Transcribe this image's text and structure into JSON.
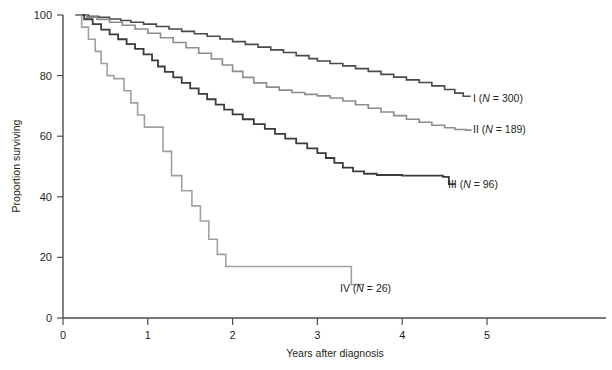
{
  "chart_data": {
    "type": "line",
    "subtype": "kaplan-meier-step",
    "title": "",
    "xlabel": "Years after diagnosis",
    "ylabel": "Proportion surviving",
    "xlim": [
      0,
      5.6
    ],
    "ylim": [
      0,
      100
    ],
    "xticks": [
      0,
      1,
      2,
      3,
      4,
      5
    ],
    "xtick_labels": [
      "0",
      "1",
      "2",
      "3",
      "4",
      "5"
    ],
    "yticks": [
      0,
      20,
      40,
      60,
      80,
      100
    ],
    "ytick_labels": [
      "0",
      "20",
      "40",
      "60",
      "80",
      "100"
    ],
    "grid": false,
    "legend_position": "right-inline-end-of-curve",
    "series": [
      {
        "name": "I",
        "n": 300,
        "label": "I (N = 300)",
        "label_roman": "I",
        "label_n_prefix": "(",
        "label_n_letter": "N",
        "label_n_value": " = 300)",
        "color": "#4a4a4a",
        "width": 1.6,
        "end_value": 73,
        "label_x": 473,
        "label_y": 102,
        "points": [
          [
            0.15,
            100
          ],
          [
            0.3,
            99.6
          ],
          [
            0.42,
            99.2
          ],
          [
            0.55,
            98.7
          ],
          [
            0.68,
            98.2
          ],
          [
            0.8,
            97.6
          ],
          [
            0.95,
            97.0
          ],
          [
            1.1,
            96.2
          ],
          [
            1.25,
            95.4
          ],
          [
            1.4,
            94.6
          ],
          [
            1.55,
            93.8
          ],
          [
            1.7,
            93.0
          ],
          [
            1.85,
            92.1
          ],
          [
            2.0,
            91.2
          ],
          [
            2.15,
            90.3
          ],
          [
            2.3,
            89.4
          ],
          [
            2.45,
            88.5
          ],
          [
            2.6,
            87.6
          ],
          [
            2.75,
            86.6
          ],
          [
            2.9,
            85.6
          ],
          [
            3.0,
            84.8
          ],
          [
            3.15,
            84.0
          ],
          [
            3.3,
            83.2
          ],
          [
            3.45,
            82.3
          ],
          [
            3.6,
            81.4
          ],
          [
            3.75,
            80.4
          ],
          [
            3.9,
            79.5
          ],
          [
            4.05,
            78.6
          ],
          [
            4.2,
            77.7
          ],
          [
            4.35,
            76.6
          ],
          [
            4.5,
            75.4
          ],
          [
            4.62,
            74.2
          ],
          [
            4.72,
            73.2
          ],
          [
            4.8,
            73.0
          ]
        ]
      },
      {
        "name": "II",
        "n": 189,
        "label": "II (N = 189)",
        "label_roman": "II",
        "label_n_prefix": "(",
        "label_n_letter": "N",
        "label_n_value": " = 189)",
        "color": "#8c8c8c",
        "width": 1.6,
        "end_value": 62,
        "label_x": 473,
        "label_y": 133,
        "points": [
          [
            0.15,
            100
          ],
          [
            0.28,
            99.3
          ],
          [
            0.4,
            98.5
          ],
          [
            0.55,
            97.6
          ],
          [
            0.7,
            96.6
          ],
          [
            0.85,
            95.4
          ],
          [
            1.0,
            94.0
          ],
          [
            1.15,
            92.5
          ],
          [
            1.3,
            90.9
          ],
          [
            1.45,
            89.2
          ],
          [
            1.6,
            87.4
          ],
          [
            1.75,
            85.5
          ],
          [
            1.88,
            83.5
          ],
          [
            2.0,
            81.4
          ],
          [
            2.12,
            79.4
          ],
          [
            2.25,
            77.6
          ],
          [
            2.4,
            76.2
          ],
          [
            2.55,
            75.2
          ],
          [
            2.7,
            74.4
          ],
          [
            2.85,
            73.8
          ],
          [
            3.0,
            73.3
          ],
          [
            3.15,
            72.6
          ],
          [
            3.3,
            71.6
          ],
          [
            3.45,
            70.4
          ],
          [
            3.6,
            69.2
          ],
          [
            3.75,
            68.0
          ],
          [
            3.9,
            66.8
          ],
          [
            4.05,
            65.6
          ],
          [
            4.2,
            64.6
          ],
          [
            4.35,
            63.6
          ],
          [
            4.5,
            62.8
          ],
          [
            4.62,
            62.2
          ],
          [
            4.75,
            62.0
          ],
          [
            4.82,
            62.0
          ]
        ]
      },
      {
        "name": "III",
        "n": 96,
        "label": "III (N = 96)",
        "label_roman": "III",
        "label_n_prefix": "(",
        "label_n_letter": "N",
        "label_n_value": " = 96)",
        "color": "#3b3b3b",
        "width": 1.8,
        "end_value": 44,
        "label_x": 448,
        "label_y": 188,
        "points": [
          [
            0.15,
            100
          ],
          [
            0.25,
            98.6
          ],
          [
            0.35,
            97.0
          ],
          [
            0.45,
            95.2
          ],
          [
            0.55,
            93.6
          ],
          [
            0.65,
            92.0
          ],
          [
            0.75,
            90.4
          ],
          [
            0.85,
            88.8
          ],
          [
            0.95,
            87.0
          ],
          [
            1.05,
            85.0
          ],
          [
            1.12,
            83.0
          ],
          [
            1.2,
            81.2
          ],
          [
            1.3,
            79.4
          ],
          [
            1.4,
            77.6
          ],
          [
            1.5,
            75.8
          ],
          [
            1.6,
            74.0
          ],
          [
            1.7,
            72.2
          ],
          [
            1.8,
            70.4
          ],
          [
            1.9,
            68.8
          ],
          [
            2.0,
            67.2
          ],
          [
            2.12,
            65.6
          ],
          [
            2.25,
            64.0
          ],
          [
            2.38,
            62.4
          ],
          [
            2.5,
            60.8
          ],
          [
            2.62,
            59.2
          ],
          [
            2.75,
            57.6
          ],
          [
            2.88,
            56.0
          ],
          [
            3.0,
            54.4
          ],
          [
            3.1,
            52.8
          ],
          [
            3.2,
            51.2
          ],
          [
            3.3,
            49.6
          ],
          [
            3.42,
            48.4
          ],
          [
            3.55,
            47.6
          ],
          [
            3.7,
            47.2
          ],
          [
            4.0,
            47.0
          ],
          [
            4.3,
            47.0
          ],
          [
            4.48,
            46.6
          ],
          [
            4.55,
            44.2
          ],
          [
            4.62,
            44.0
          ]
        ]
      },
      {
        "name": "IV",
        "n": 26,
        "label": "IV (N = 26)",
        "label_roman": "IV",
        "label_n_prefix": "(",
        "label_n_letter": "N",
        "label_n_value": " = 26)",
        "color": "#a0a0a0",
        "width": 1.6,
        "end_value": 11,
        "label_x": 340,
        "label_y": 292,
        "points": [
          [
            0.15,
            100
          ],
          [
            0.22,
            96.0
          ],
          [
            0.3,
            92.0
          ],
          [
            0.38,
            88.0
          ],
          [
            0.45,
            84.0
          ],
          [
            0.52,
            80.0
          ],
          [
            0.6,
            79.0
          ],
          [
            0.72,
            75.0
          ],
          [
            0.8,
            71.0
          ],
          [
            0.88,
            67.0
          ],
          [
            0.96,
            63.0
          ],
          [
            1.05,
            63.0
          ],
          [
            1.18,
            55.0
          ],
          [
            1.28,
            47.0
          ],
          [
            1.4,
            42.0
          ],
          [
            1.52,
            37.0
          ],
          [
            1.62,
            32.0
          ],
          [
            1.72,
            26.0
          ],
          [
            1.82,
            21.0
          ],
          [
            1.92,
            17.0
          ],
          [
            2.1,
            17.0
          ],
          [
            2.6,
            17.0
          ],
          [
            3.1,
            17.0
          ],
          [
            3.32,
            17.0
          ],
          [
            3.4,
            11.0
          ],
          [
            3.55,
            11.0
          ]
        ]
      }
    ]
  },
  "axes": {
    "x_title": "Years after diagnosis",
    "y_title": "Proportion surviving"
  }
}
